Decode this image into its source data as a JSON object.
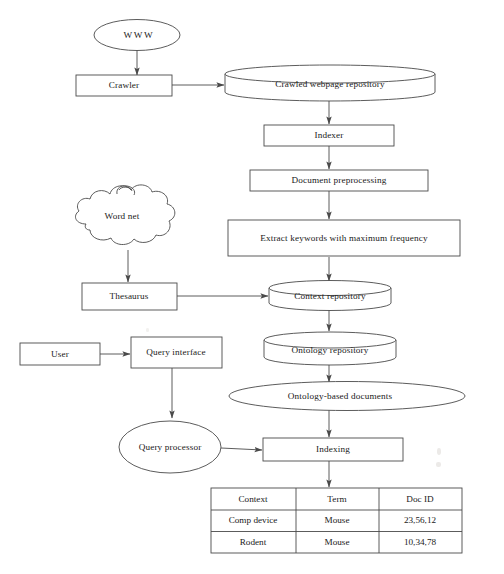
{
  "diagram": {
    "nodes": {
      "www": {
        "label": "WWW",
        "shape": "ellipse"
      },
      "crawler": {
        "label": "Crawler",
        "shape": "rectangle"
      },
      "crawled_repo": {
        "label": "Crawled webpage repository",
        "shape": "cylinder"
      },
      "indexer": {
        "label": "Indexer",
        "shape": "rectangle"
      },
      "doc_preprocessing": {
        "label": "Document preprocessing",
        "shape": "rectangle"
      },
      "word_net": {
        "label": "Word net",
        "shape": "cloud"
      },
      "extract_keywords": {
        "label": "Extract keywords with maximum frequency",
        "shape": "rectangle"
      },
      "thesaurus": {
        "label": "Thesaurus",
        "shape": "rectangle"
      },
      "context_repo": {
        "label": "Context repository",
        "shape": "cylinder"
      },
      "user": {
        "label": "User",
        "shape": "rectangle"
      },
      "query_interface": {
        "label": "Query interface",
        "shape": "rectangle"
      },
      "ontology_repo": {
        "label": "Ontology repository",
        "shape": "cylinder"
      },
      "ontology_docs": {
        "label": "Ontology-based documents",
        "shape": "ellipse"
      },
      "query_processor": {
        "label": "Query processor",
        "shape": "ellipse"
      },
      "indexing": {
        "label": "Indexing",
        "shape": "rectangle"
      }
    },
    "edges": [
      {
        "from": "www",
        "to": "crawler"
      },
      {
        "from": "crawler",
        "to": "crawled_repo"
      },
      {
        "from": "crawled_repo",
        "to": "indexer"
      },
      {
        "from": "indexer",
        "to": "doc_preprocessing"
      },
      {
        "from": "doc_preprocessing",
        "to": "extract_keywords"
      },
      {
        "from": "extract_keywords",
        "to": "context_repo"
      },
      {
        "from": "word_net",
        "to": "thesaurus"
      },
      {
        "from": "thesaurus",
        "to": "context_repo"
      },
      {
        "from": "context_repo",
        "to": "ontology_repo"
      },
      {
        "from": "ontology_repo",
        "to": "ontology_docs"
      },
      {
        "from": "ontology_docs",
        "to": "indexing"
      },
      {
        "from": "user",
        "to": "query_interface"
      },
      {
        "from": "query_interface",
        "to": "query_processor"
      },
      {
        "from": "query_processor",
        "to": "indexing"
      },
      {
        "from": "indexing",
        "to": "index_table"
      }
    ],
    "index_table": {
      "columns": [
        "Context",
        "Term",
        "Doc ID"
      ],
      "rows": [
        [
          "Comp device",
          "Mouse",
          "23,56,12"
        ],
        [
          "Rodent",
          "Mouse",
          "10,34,78"
        ]
      ]
    }
  },
  "colors": {
    "stroke": "#4a4a4a",
    "text": "#1a1a1a",
    "background": "#ffffff"
  }
}
